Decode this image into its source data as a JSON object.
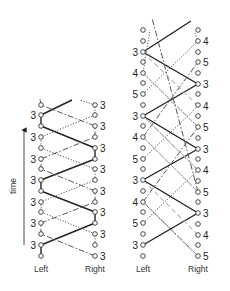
{
  "time_axis": {
    "label": "time",
    "x": 24,
    "y_start": 245,
    "y_end": 126,
    "label_x": 16,
    "label_y": 186
  },
  "diagrams": [
    {
      "name": "siteswap-3",
      "left_x": 41,
      "right_x": 95,
      "column_labels": {
        "left": "Left",
        "right": "Right",
        "y": 272
      },
      "left_nodes_y": [
        105,
        115,
        126,
        137,
        148,
        159,
        169,
        180,
        191,
        202,
        212,
        223,
        234,
        245,
        256
      ],
      "right_nodes_y": [
        105,
        115,
        126,
        137,
        148,
        159,
        169,
        180,
        191,
        202,
        212,
        223,
        234,
        245,
        256
      ],
      "left_labels": [
        {
          "text": "3",
          "y": 115
        },
        {
          "text": "3",
          "y": 137
        },
        {
          "text": "3",
          "y": 159
        },
        {
          "text": "3",
          "y": 180
        },
        {
          "text": "3",
          "y": 202
        },
        {
          "text": "3",
          "y": 223
        },
        {
          "text": "3",
          "y": 245
        }
      ],
      "right_labels": [
        {
          "text": "3",
          "y": 105
        },
        {
          "text": "3",
          "y": 126
        },
        {
          "text": "3",
          "y": 148
        },
        {
          "text": "3",
          "y": 169
        },
        {
          "text": "3",
          "y": 191
        },
        {
          "text": "3",
          "y": 212
        },
        {
          "text": "3",
          "y": 234
        },
        {
          "text": "3",
          "y": 256
        }
      ],
      "paths": [
        {
          "style": "solid",
          "points": [
            [
              41,
              256
            ],
            [
              41,
              245
            ],
            [
              95,
              223
            ],
            [
              95,
              212
            ],
            [
              41,
              191
            ],
            [
              41,
              180
            ],
            [
              95,
              159
            ],
            [
              95,
              148
            ],
            [
              41,
              126
            ],
            [
              41,
              115
            ],
            [
              72,
              100
            ]
          ]
        },
        {
          "style": "dashdot",
          "points": [
            [
              95,
              256
            ],
            [
              41,
              234
            ],
            [
              41,
              223
            ],
            [
              95,
              202
            ],
            [
              95,
              191
            ],
            [
              41,
              169
            ],
            [
              41,
              159
            ],
            [
              95,
              137
            ],
            [
              95,
              126
            ],
            [
              41,
              105
            ],
            [
              40,
              99
            ]
          ]
        },
        {
          "style": "dotted",
          "points": [
            [
              95,
              245
            ],
            [
              95,
              234
            ],
            [
              41,
              212
            ],
            [
              41,
              202
            ],
            [
              95,
              180
            ],
            [
              95,
              169
            ],
            [
              41,
              148
            ],
            [
              41,
              137
            ],
            [
              95,
              115
            ],
            [
              95,
              105
            ],
            [
              80,
              100
            ]
          ]
        }
      ]
    },
    {
      "name": "siteswap-453",
      "left_x": 143,
      "right_x": 198,
      "column_labels": {
        "left": "Left",
        "right": "Right",
        "y": 272
      },
      "left_nodes_y": [
        30,
        41,
        52,
        62,
        73,
        83,
        94,
        105,
        116,
        126,
        137,
        148,
        159,
        169,
        180,
        191,
        202,
        212,
        223,
        234,
        245,
        256
      ],
      "right_nodes_y": [
        30,
        41,
        52,
        62,
        73,
        84,
        94,
        105,
        116,
        127,
        138,
        149,
        159,
        170,
        181,
        192,
        202,
        213,
        224,
        235,
        245,
        256
      ],
      "left_labels": [
        {
          "text": "3",
          "y": 52
        },
        {
          "text": "4",
          "y": 73
        },
        {
          "text": "5",
          "y": 94
        },
        {
          "text": "3",
          "y": 116
        },
        {
          "text": "4",
          "y": 137
        },
        {
          "text": "5",
          "y": 159
        },
        {
          "text": "3",
          "y": 180
        },
        {
          "text": "4",
          "y": 202
        },
        {
          "text": "5",
          "y": 223
        },
        {
          "text": "3",
          "y": 245
        }
      ],
      "right_labels": [
        {
          "text": "4",
          "y": 41
        },
        {
          "text": "5",
          "y": 62
        },
        {
          "text": "3",
          "y": 84
        },
        {
          "text": "4",
          "y": 106
        },
        {
          "text": "5",
          "y": 127
        },
        {
          "text": "3",
          "y": 149
        },
        {
          "text": "4",
          "y": 170
        },
        {
          "text": "5",
          "y": 192
        },
        {
          "text": "3",
          "y": 213
        },
        {
          "text": "4",
          "y": 235
        },
        {
          "text": "5",
          "y": 256
        }
      ],
      "paths": [
        {
          "style": "solid",
          "points": [
            [
              143,
              245
            ],
            [
              198,
              213
            ],
            [
              143,
              180
            ],
            [
              198,
              149
            ],
            [
              143,
              116
            ],
            [
              198,
              84
            ],
            [
              143,
              52
            ],
            [
              191,
              21
            ]
          ]
        },
        {
          "style": "dotted",
          "points": [
            [
              143,
              223
            ],
            [
              198,
              170
            ],
            [
              198,
              170
            ],
            [
              143,
              116
            ]
          ]
        },
        {
          "style": "dotted",
          "points": [
            [
              143,
              94
            ],
            [
              198,
              41
            ],
            [
              195,
              33
            ]
          ]
        },
        {
          "style": "dotted",
          "points": [
            [
              198,
              256
            ],
            [
              143,
              202
            ]
          ]
        },
        {
          "style": "dotted",
          "points": [
            [
              198,
              192
            ],
            [
              143,
              137
            ]
          ]
        },
        {
          "style": "dotted",
          "points": [
            [
              143,
              159
            ],
            [
              198,
              106
            ]
          ]
        },
        {
          "style": "dotted",
          "points": [
            [
              198,
              127
            ],
            [
              143,
              73
            ],
            [
              150,
              30
            ]
          ]
        },
        {
          "style": "dashdot",
          "points": [
            [
              198,
              256
            ],
            [
              143,
              202
            ]
          ]
        },
        {
          "style": "dashdot",
          "points": [
            [
              143,
              202
            ],
            [
              198,
              127
            ]
          ]
        },
        {
          "style": "dashdot",
          "points": [
            [
              198,
              192
            ],
            [
              152,
              18
            ]
          ]
        },
        {
          "style": "dashdot",
          "points": [
            [
              143,
              137
            ],
            [
              198,
              62
            ]
          ]
        },
        {
          "style": "lightdash",
          "points": [
            [
              143,
              73
            ],
            [
              198,
              127
            ]
          ]
        },
        {
          "style": "lightdash",
          "points": [
            [
              143,
              137
            ],
            [
              198,
              192
            ]
          ]
        },
        {
          "style": "lightdash",
          "points": [
            [
              143,
              202
            ],
            [
              198,
              256
            ]
          ]
        },
        {
          "style": "lightdash",
          "points": [
            [
              198,
              106
            ],
            [
              143,
              52
            ]
          ]
        },
        {
          "style": "lightdash",
          "points": [
            [
              198,
              170
            ],
            [
              143,
              116
            ]
          ]
        },
        {
          "style": "lightdash",
          "points": [
            [
              198,
              235
            ],
            [
              143,
              180
            ]
          ]
        }
      ]
    }
  ],
  "colors": {
    "solid": "#222222",
    "dashdot": "#555555",
    "dotted": "#555555",
    "lightdash": "#b5b5b5",
    "node_stroke": "#333333"
  }
}
